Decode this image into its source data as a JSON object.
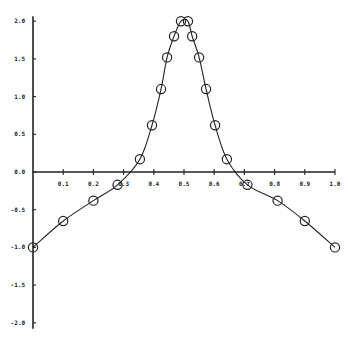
{
  "chart_data": {
    "type": "line",
    "title": "",
    "xlabel": "",
    "ylabel": "",
    "xlim": [
      0.0,
      1.0
    ],
    "ylim": [
      -2.0,
      2.0
    ],
    "grid": false,
    "legend": null,
    "x_ticks": [
      "0.1",
      "0.2",
      "0.3",
      "0.4",
      "0.5",
      "0.6",
      "0.7",
      "0.8",
      "0.9",
      "1.0"
    ],
    "y_ticks": [
      "2.0",
      "1.5",
      "1.0",
      "0.5",
      "0.0",
      "-0.5",
      "-1.0",
      "-1.5",
      "-2.0"
    ],
    "markers": "open-circle",
    "series": [
      {
        "name": "curve",
        "x": [
          0.0,
          0.1,
          0.2,
          0.28,
          0.354,
          0.394,
          0.424,
          0.444,
          0.467,
          0.49,
          0.513,
          0.527,
          0.55,
          0.573,
          0.603,
          0.642,
          0.71,
          0.81,
          0.9,
          1.0
        ],
        "y": [
          -1.0,
          -0.65,
          -0.38,
          -0.17,
          0.17,
          0.62,
          1.1,
          1.52,
          1.8,
          2.0,
          2.0,
          1.8,
          1.52,
          1.1,
          0.62,
          0.17,
          -0.17,
          -0.38,
          -0.65,
          -1.0
        ]
      }
    ]
  }
}
